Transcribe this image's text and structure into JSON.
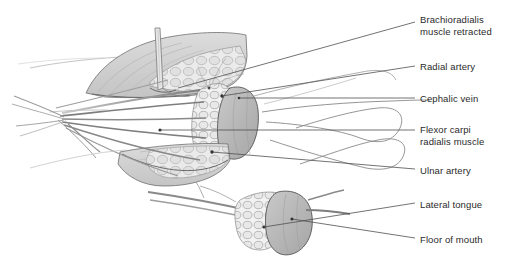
{
  "figure": {
    "title_text": "",
    "background_color": "#ffffff",
    "text_color": "#2a2a2a",
    "line_color": "#5a5a5a",
    "muscle_fill": "#d2d2d2",
    "flap_fill": "#b8b8b8",
    "fat_fill": "#e4e4e4",
    "vessel_color": "#6b6b6b",
    "labels": [
      {
        "id": "brachioradialis",
        "text": "Brachioradialis\nmuscle retracted",
        "x": 420,
        "y": 14,
        "leader": {
          "x1": 415,
          "y1": 22,
          "x2": 178,
          "y2": 88
        }
      },
      {
        "id": "radial-artery",
        "text": "Radial artery",
        "x": 420,
        "y": 61,
        "leader": {
          "x1": 415,
          "y1": 66,
          "x2": 222,
          "y2": 96
        }
      },
      {
        "id": "cephalic-vein",
        "text": "Cephalic vein",
        "x": 420,
        "y": 93,
        "leader": {
          "x1": 415,
          "y1": 98,
          "x2": 239,
          "y2": 98
        }
      },
      {
        "id": "flexor-carpi-radialis",
        "text": "Flexor carpi\nradialis muscle",
        "x": 420,
        "y": 124,
        "leader": {
          "x1": 415,
          "y1": 130,
          "x2": 160,
          "y2": 130
        }
      },
      {
        "id": "ulnar-artery",
        "text": "Ulnar artery",
        "x": 420,
        "y": 165,
        "leader": {
          "x1": 415,
          "y1": 169,
          "x2": 212,
          "y2": 152
        }
      },
      {
        "id": "lateral-tongue",
        "text": "Lateral tongue",
        "x": 420,
        "y": 199,
        "leader": {
          "x1": 415,
          "y1": 203,
          "x2": 264,
          "y2": 227
        }
      },
      {
        "id": "floor-of-mouth",
        "text": "Floor of mouth",
        "x": 420,
        "y": 234,
        "leader": {
          "x1": 415,
          "y1": 238,
          "x2": 292,
          "y2": 219
        }
      }
    ],
    "anatomy_parts": [
      {
        "id": "upper-muscle-belly",
        "name": "brachioradialis-muscle-retracted"
      },
      {
        "id": "lower-muscle-belly",
        "name": "flexor-carpi-radialis-muscle"
      },
      {
        "id": "fat-tissue-upper",
        "name": "subcutaneous-fat-upper"
      },
      {
        "id": "fat-tissue-lower",
        "name": "subcutaneous-fat-lower"
      },
      {
        "id": "skin-paddle",
        "name": "radial-forearm-skin-paddle"
      },
      {
        "id": "retractor",
        "name": "surgical-retractor"
      },
      {
        "id": "radial-artery-vessel",
        "name": "radial-artery-pedicle"
      },
      {
        "id": "cephalic-vein-vessel",
        "name": "cephalic-vein-pedicle"
      },
      {
        "id": "ulnar-artery-vessel",
        "name": "ulnar-artery-pedicle"
      },
      {
        "id": "tendon-bundle",
        "name": "wrist-tendon-bundle"
      },
      {
        "id": "tongue-flap",
        "name": "lateral-tongue-flap"
      },
      {
        "id": "floor-mouth-tissue",
        "name": "floor-of-mouth-tissue"
      }
    ]
  }
}
